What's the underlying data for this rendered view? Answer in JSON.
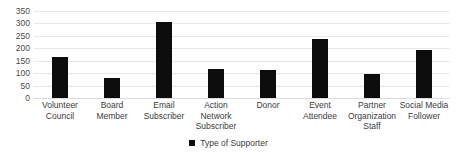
{
  "chart_data": {
    "type": "bar",
    "title": "",
    "subtitle": "",
    "xlabel": "",
    "ylabel": "",
    "categories": [
      "Volunteer Council",
      "Board Member",
      "Email Subscriber",
      "Action Network Subscriber",
      "Donor",
      "Event Attendee",
      "Partner Organization Staff",
      "Social Media Follower"
    ],
    "series": [
      {
        "name": "Type of Supporter",
        "color": "#0d0d0d",
        "values": [
          163,
          82,
          307,
          118,
          112,
          237,
          95,
          192
        ]
      }
    ],
    "values": [
      163,
      82,
      307,
      118,
      112,
      237,
      95,
      192
    ],
    "ylim": [
      0,
      350
    ],
    "ytick_step": 50,
    "yticks": [
      350,
      300,
      250,
      200,
      150,
      100,
      50,
      0
    ],
    "ytick_labels": [
      "350",
      "300",
      "250",
      "200",
      "150",
      "100",
      "50",
      "0"
    ],
    "grid": true,
    "grid_axis": "y",
    "grid_color": "#e8e8e8",
    "legend": {
      "position": "bottom-center",
      "entries": [
        {
          "label": "Type of Supporter",
          "color": "#0d0d0d",
          "marker": "square"
        }
      ]
    },
    "colors": {
      "bar": "#0d0d0d",
      "text": "#3b3b3b",
      "grid": "#e8e8e8",
      "background": "#ffffff"
    }
  }
}
